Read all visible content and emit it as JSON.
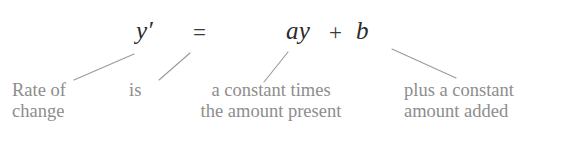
{
  "figure": {
    "kind": "annotated-equation-diagram",
    "background_color": "#ffffff",
    "equation_color": "#2b2b2b",
    "label_color": "#8d8d8d",
    "connector_color": "#9a9a9a"
  },
  "equation": {
    "full": "y' = ay + b",
    "tokens": {
      "derivative": "y′",
      "equals": "=",
      "rate_term": "ay",
      "plus": "+",
      "constant_term": "b"
    }
  },
  "annotations": [
    {
      "id": "rate-of-change",
      "targets": "y′",
      "line1": "Rate of",
      "line2": "change"
    },
    {
      "id": "is",
      "targets": "=",
      "line1": "is",
      "line2": ""
    },
    {
      "id": "constant-times-amount",
      "targets": "ay",
      "line1": "a constant times",
      "line2": "the amount present"
    },
    {
      "id": "plus-constant-amount",
      "targets": "b",
      "line1": "plus a constant",
      "line2": "amount added"
    }
  ]
}
